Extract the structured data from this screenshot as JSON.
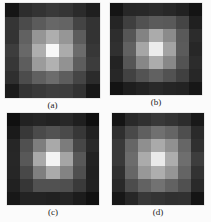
{
  "figure": {
    "title": "",
    "background_color": "#fbfbfb",
    "layout": "2x2 grid of grayscale image patches"
  },
  "chart_data": [
    {
      "type": "heatmap",
      "title": "(a)",
      "caption": "(a)",
      "xlabel": "",
      "ylabel": "",
      "grid": false,
      "legend": "none",
      "colormap": "gray",
      "vmin": 0,
      "vmax": 255,
      "rows": 7,
      "cols": 7,
      "values": [
        [
          26,
          48,
          56,
          60,
          56,
          48,
          26
        ],
        [
          48,
          72,
          96,
          104,
          96,
          72,
          48
        ],
        [
          56,
          96,
          150,
          176,
          150,
          96,
          56
        ],
        [
          60,
          104,
          176,
          243,
          176,
          104,
          60
        ],
        [
          56,
          96,
          150,
          176,
          150,
          96,
          56
        ],
        [
          48,
          72,
          96,
          104,
          96,
          72,
          48
        ],
        [
          26,
          48,
          56,
          60,
          56,
          48,
          26
        ]
      ]
    },
    {
      "type": "heatmap",
      "title": "(b)",
      "caption": "(b)",
      "xlabel": "",
      "ylabel": "",
      "grid": false,
      "legend": "none",
      "colormap": "gray",
      "vmin": 0,
      "vmax": 255,
      "rows": 7,
      "cols": 7,
      "values": [
        [
          24,
          34,
          40,
          44,
          40,
          34,
          24
        ],
        [
          34,
          64,
          84,
          92,
          84,
          64,
          34
        ],
        [
          40,
          84,
          136,
          168,
          136,
          84,
          40
        ],
        [
          44,
          92,
          168,
          238,
          168,
          92,
          44
        ],
        [
          40,
          84,
          136,
          168,
          136,
          84,
          40
        ],
        [
          34,
          64,
          84,
          92,
          84,
          64,
          34
        ],
        [
          24,
          34,
          40,
          44,
          40,
          34,
          24
        ]
      ]
    },
    {
      "type": "heatmap",
      "title": "(c)",
      "caption": "(c)",
      "xlabel": "",
      "ylabel": "",
      "grid": false,
      "legend": "none",
      "colormap": "gray",
      "vmin": 0,
      "vmax": 255,
      "rows": 7,
      "cols": 7,
      "values": [
        [
          20,
          30,
          36,
          38,
          36,
          30,
          20
        ],
        [
          30,
          56,
          76,
          84,
          76,
          56,
          30
        ],
        [
          36,
          76,
          128,
          170,
          128,
          76,
          36
        ],
        [
          38,
          84,
          170,
          248,
          170,
          84,
          38
        ],
        [
          36,
          76,
          128,
          170,
          128,
          76,
          36
        ],
        [
          30,
          56,
          76,
          84,
          76,
          56,
          30
        ],
        [
          20,
          30,
          36,
          38,
          36,
          30,
          20
        ]
      ]
    },
    {
      "type": "heatmap",
      "title": "(d)",
      "caption": "(d)",
      "xlabel": "",
      "ylabel": "",
      "grid": false,
      "legend": "none",
      "colormap": "gray",
      "vmin": 0,
      "vmax": 255,
      "rows": 7,
      "cols": 7,
      "values": [
        [
          22,
          44,
          52,
          56,
          52,
          44,
          22
        ],
        [
          44,
          76,
          100,
          110,
          100,
          76,
          44
        ],
        [
          52,
          100,
          148,
          172,
          148,
          100,
          52
        ],
        [
          56,
          110,
          172,
          236,
          172,
          110,
          56
        ],
        [
          52,
          100,
          148,
          172,
          148,
          100,
          52
        ],
        [
          44,
          76,
          100,
          110,
          100,
          76,
          44
        ],
        [
          22,
          44,
          52,
          56,
          52,
          44,
          22
        ]
      ]
    }
  ]
}
